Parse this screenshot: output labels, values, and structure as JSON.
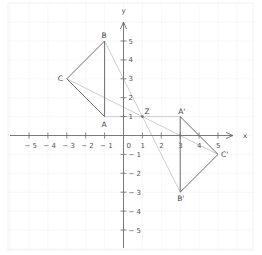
{
  "diagram": {
    "type": "coordinate-plane-rotation",
    "axes": {
      "x_label": "x",
      "y_label": "y",
      "origin_label": "0",
      "x_ticks": [
        -5,
        -4,
        -3,
        -2,
        -1,
        1,
        2,
        3,
        4,
        5
      ],
      "y_ticks": [
        5,
        4,
        3,
        2,
        1,
        -1,
        -2,
        -3,
        -4,
        -5
      ],
      "x_tick_labels": [
        "− 5",
        "− 4",
        "− 3",
        "− 2",
        "− 1",
        "1",
        "2",
        "3",
        "4",
        "5"
      ],
      "y_tick_labels": [
        "5",
        "4",
        "3",
        "2",
        "1",
        "− 1",
        "− 2",
        "− 3",
        "− 4",
        "− 5"
      ]
    },
    "points": {
      "A": {
        "label": "A",
        "x": -1,
        "y": 1
      },
      "B": {
        "label": "B",
        "x": -1,
        "y": 5
      },
      "C": {
        "label": "C",
        "x": -3,
        "y": 3
      },
      "A_prime": {
        "label": "A'",
        "x": 3,
        "y": 1
      },
      "B_prime": {
        "label": "B'",
        "x": 3,
        "y": -3
      },
      "C_prime": {
        "label": "C'",
        "x": 5,
        "y": -1
      },
      "Z": {
        "label": "Z",
        "x": 1,
        "y": 1
      }
    },
    "triangles": [
      {
        "name": "ABC",
        "vertices": [
          "A",
          "B",
          "C"
        ]
      },
      {
        "name": "A'B'C'",
        "vertices": [
          "A_prime",
          "B_prime",
          "C_prime"
        ]
      }
    ],
    "construction_lines": [
      [
        "B",
        "B_prime"
      ],
      [
        "C",
        "C_prime"
      ],
      [
        "A",
        "A_prime"
      ]
    ],
    "colors": {
      "axis": "#6b6b6b",
      "triangle": "#6e6e6e",
      "construction": "#c8c8c8",
      "grid": "#f2f2f2"
    }
  }
}
